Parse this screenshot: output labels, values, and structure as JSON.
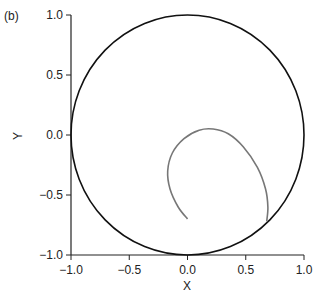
{
  "panel_label": "(b)",
  "chart_data": {
    "type": "line",
    "title": "",
    "xlabel": "X",
    "ylabel": "Y",
    "xlim": [
      -1.0,
      1.0
    ],
    "ylim": [
      -1.0,
      1.0
    ],
    "xticks": [
      "-1.0",
      "-0.5",
      "0.0",
      "0.5",
      "1.0"
    ],
    "yticks": [
      "-1.0",
      "-0.5",
      "0.0",
      "0.5",
      "1.0"
    ],
    "grid": false,
    "series": [
      {
        "name": "unit circle",
        "color": "#111111",
        "shape": "circle",
        "center": [
          0,
          0
        ],
        "radius": 1.0
      },
      {
        "name": "trajectory",
        "color": "#777777",
        "x": [
          0.0,
          -0.08,
          -0.15,
          -0.17,
          -0.13,
          -0.03,
          0.1,
          0.22,
          0.35,
          0.48,
          0.6,
          0.67,
          0.69,
          0.68
        ],
        "y": [
          -0.7,
          -0.6,
          -0.45,
          -0.3,
          -0.15,
          -0.03,
          0.04,
          0.05,
          0.01,
          -0.1,
          -0.27,
          -0.45,
          -0.6,
          -0.72
        ]
      }
    ]
  }
}
